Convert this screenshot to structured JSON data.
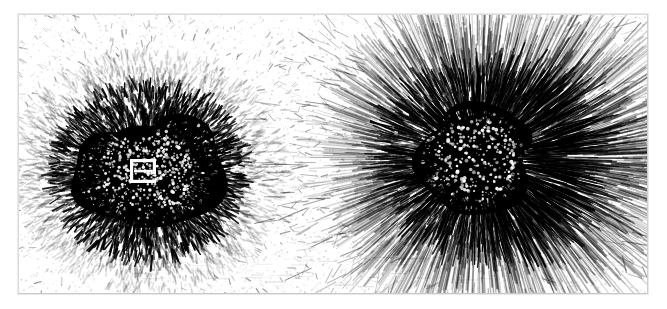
{
  "figure": {
    "kind": "scanned photographic plate",
    "panel_count": 2,
    "background_color": "#ffffff",
    "ink_color": "#000000",
    "speckle_color": "#9a9a9a",
    "border_color": "#dcdcdc",
    "plate": {
      "x": 18,
      "y": 14,
      "width": 630,
      "height": 280
    },
    "caption": ""
  },
  "panels": [
    {
      "id": "left-panel",
      "label": "",
      "pattern_type": "dipole",
      "description": "Two merged dark lobes of dense iron filings with short radiating dash filaments; a small white bar-magnet outline visible at the centre.",
      "center": {
        "x": 148,
        "y": 172
      },
      "core_radius_x": 78,
      "core_radius_y": 70,
      "halo_radius_x": 135,
      "halo_radius_y": 118,
      "filament_count": 2600,
      "filament_length_min": 3,
      "filament_length_max": 16,
      "filament_width": 1.5,
      "lobes": [
        {
          "cx": 112,
          "cy": 176,
          "rx": 40,
          "ry": 44,
          "rot": -12
        },
        {
          "cx": 182,
          "cy": 168,
          "rx": 44,
          "ry": 52,
          "rot": 8
        }
      ],
      "magnet_marker": {
        "name": "bar-magnet-outline",
        "x": 130,
        "y": 159,
        "width": 26,
        "height": 24,
        "color": "#ffffff"
      }
    },
    {
      "id": "right-panel",
      "label": "",
      "pattern_type": "monopole-radial",
      "description": "Single dense dark core with long straight streaks of filings radiating outward, longest toward the right.",
      "center": {
        "x": 478,
        "y": 158
      },
      "core_radius_x": 58,
      "core_radius_y": 55,
      "halo_radius_x": 150,
      "halo_radius_y": 118,
      "filament_count": 2400,
      "filament_length_min": 8,
      "filament_length_max": 62,
      "filament_width": 1.3
    }
  ],
  "background_noise": {
    "name": "halftone-speckle",
    "dot_count": 5200,
    "dot_size_min": 0.6,
    "dot_size_max": 1.9,
    "opacity_min": 0.12,
    "opacity_max": 0.55
  }
}
